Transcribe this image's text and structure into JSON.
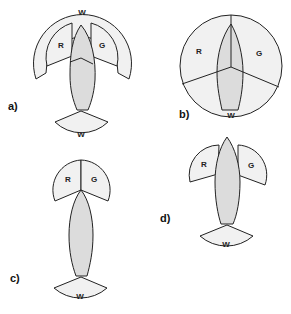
{
  "figure": {
    "colors": {
      "sector_fill": "#f1f1f1",
      "hull_fill": "#dcdcdc",
      "stroke": "#222222"
    },
    "panels": [
      {
        "id": "a",
        "label": "a)",
        "lights": {
          "port": "R",
          "starboard": "G",
          "masthead": "W",
          "stern": "W"
        }
      },
      {
        "id": "b",
        "label": "b)",
        "lights": {
          "port": "R",
          "starboard": "G",
          "stern": "W"
        }
      },
      {
        "id": "c",
        "label": "c)",
        "lights": {
          "port": "R",
          "starboard": "G",
          "stern": "W"
        }
      },
      {
        "id": "d",
        "label": "d)",
        "lights": {
          "port": "R",
          "starboard": "G",
          "stern": "W"
        }
      }
    ]
  }
}
